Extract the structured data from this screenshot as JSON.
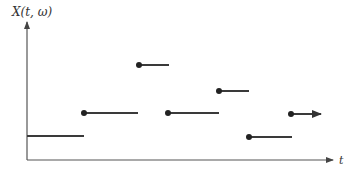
{
  "diagram": {
    "y_axis_label": "X(t, ω)",
    "x_axis_label": "t",
    "colors": {
      "line": "#3a3a3a",
      "axis": "#555555",
      "background": "#ffffff"
    },
    "axes": {
      "origin": [
        27,
        160
      ],
      "y_tip": [
        27,
        22
      ],
      "x_tip": [
        333,
        160
      ]
    },
    "segments": [
      {
        "x1": 27,
        "x2": 84,
        "y": 136,
        "start_dot": false,
        "end_arrow": false
      },
      {
        "x1": 84,
        "x2": 138,
        "y": 113,
        "start_dot": true,
        "end_arrow": false
      },
      {
        "x1": 139,
        "x2": 169,
        "y": 65,
        "start_dot": true,
        "end_arrow": false
      },
      {
        "x1": 168,
        "x2": 219,
        "y": 113,
        "start_dot": true,
        "end_arrow": false
      },
      {
        "x1": 219,
        "x2": 249,
        "y": 91,
        "start_dot": true,
        "end_arrow": false
      },
      {
        "x1": 249,
        "x2": 292,
        "y": 137,
        "start_dot": true,
        "end_arrow": false
      },
      {
        "x1": 291,
        "x2": 321,
        "y": 114,
        "start_dot": true,
        "end_arrow": true
      }
    ]
  }
}
